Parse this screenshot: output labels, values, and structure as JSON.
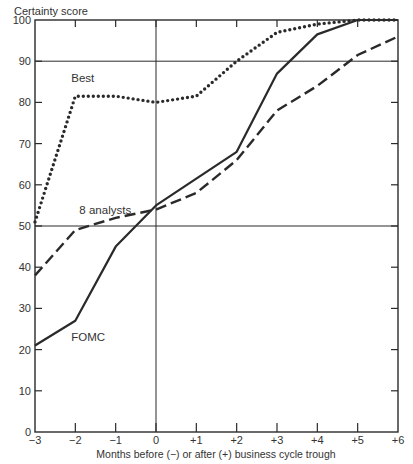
{
  "chart_data": {
    "type": "line",
    "title": "",
    "ylabel": "Certainty score",
    "xlabel": "Months before (−) or after (+) business cycle trough",
    "x": [
      -3,
      -2,
      -1,
      0,
      1,
      2,
      3,
      4,
      5,
      6
    ],
    "x_tick_labels": [
      "−3",
      "−2",
      "−1",
      "0",
      "+1",
      "+2",
      "+3",
      "+4",
      "+5",
      "+6"
    ],
    "y_ticks": [
      0,
      10,
      20,
      30,
      40,
      50,
      60,
      70,
      80,
      90,
      100
    ],
    "xlim": [
      -3,
      6
    ],
    "ylim": [
      0,
      100
    ],
    "reference_lines": {
      "horizontal": [
        50,
        90
      ],
      "vertical": [
        0
      ]
    },
    "grid": false,
    "legend": "inline labels",
    "series": [
      {
        "name": "Best",
        "style": "dotted",
        "values": [
          51,
          81.5,
          81.5,
          80,
          81.5,
          90,
          97,
          99,
          100,
          100
        ]
      },
      {
        "name": "8 analysts",
        "style": "dashed",
        "values": [
          38,
          49,
          52,
          54,
          58,
          66,
          78,
          84,
          91.5,
          96
        ]
      },
      {
        "name": "FOMC",
        "style": "solid",
        "values": [
          21,
          27,
          45,
          55,
          61.5,
          68,
          87,
          96.5,
          100,
          100
        ]
      }
    ],
    "annotations": [
      {
        "text": "Best",
        "x": -2.1,
        "y": 85
      },
      {
        "text": "8 analysts",
        "x": -1.9,
        "y": 53
      },
      {
        "text": "FOMC",
        "x": -2.1,
        "y": 22
      }
    ]
  }
}
